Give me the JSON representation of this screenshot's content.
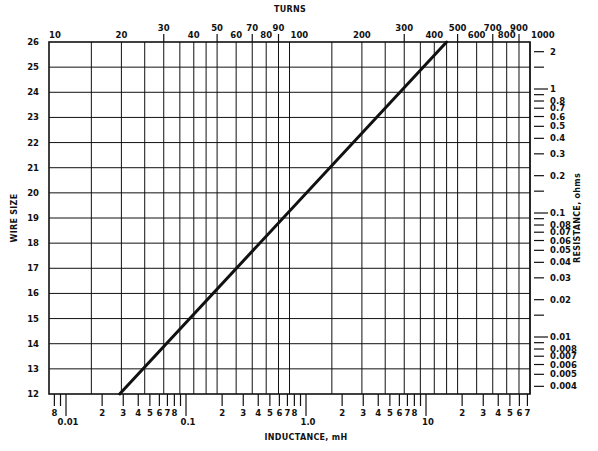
{
  "chart_data": {
    "type": "line",
    "title": "",
    "top_axis": {
      "label": "TURNS",
      "scale": "log",
      "range": [
        10,
        1000
      ],
      "tick_labels": [
        "10",
        "20",
        "30",
        "40",
        "50",
        "60",
        "70",
        "80",
        "90",
        "100",
        "200",
        "300",
        "400",
        "500",
        "600",
        "700",
        "800",
        "900",
        "1000"
      ],
      "tick_values": [
        10,
        20,
        30,
        40,
        50,
        60,
        70,
        80,
        90,
        100,
        200,
        300,
        400,
        500,
        600,
        700,
        800,
        900,
        1000
      ],
      "gridlines": [
        15,
        20,
        25,
        30,
        35,
        40,
        45,
        50,
        60,
        70,
        80,
        90,
        100,
        150,
        200,
        250,
        300,
        350,
        400,
        450,
        500,
        600,
        700,
        800,
        900,
        1000
      ]
    },
    "bottom_axis": {
      "label": "INDUCTANCE, mH",
      "scale": "log",
      "range": [
        0.0066,
        75
      ],
      "major_labels": [
        "0.01",
        "0.1",
        "1.0",
        "10"
      ],
      "major_values": [
        0.01,
        0.1,
        1.0,
        10
      ],
      "minor_labels": [
        {
          "text": "8",
          "value": 0.008
        },
        {
          "text": "2",
          "value": 0.02
        },
        {
          "text": "3",
          "value": 0.03
        },
        {
          "text": "4",
          "value": 0.04
        },
        {
          "text": "5",
          "value": 0.05
        },
        {
          "text": "6",
          "value": 0.06
        },
        {
          "text": "7",
          "value": 0.07
        },
        {
          "text": "8",
          "value": 0.08
        },
        {
          "text": "2",
          "value": 0.2
        },
        {
          "text": "3",
          "value": 0.3
        },
        {
          "text": "4",
          "value": 0.4
        },
        {
          "text": "5",
          "value": 0.5
        },
        {
          "text": "6",
          "value": 0.6
        },
        {
          "text": "7",
          "value": 0.7
        },
        {
          "text": "8",
          "value": 0.8
        },
        {
          "text": "2",
          "value": 2
        },
        {
          "text": "3",
          "value": 3
        },
        {
          "text": "4",
          "value": 4
        },
        {
          "text": "5",
          "value": 5
        },
        {
          "text": "6",
          "value": 6
        },
        {
          "text": "7",
          "value": 7
        },
        {
          "text": "8",
          "value": 8
        },
        {
          "text": "2",
          "value": 20
        },
        {
          "text": "3",
          "value": 30
        },
        {
          "text": "4",
          "value": 40
        },
        {
          "text": "5",
          "value": 50
        },
        {
          "text": "6",
          "value": 60
        },
        {
          "text": "7",
          "value": 70
        }
      ]
    },
    "left_axis": {
      "label": "WIRE SIZE",
      "range": [
        12,
        26
      ],
      "tick_labels": [
        "12",
        "13",
        "14",
        "15",
        "16",
        "17",
        "18",
        "19",
        "20",
        "21",
        "22",
        "23",
        "24",
        "25",
        "26"
      ],
      "gridlines": true
    },
    "right_axis": {
      "label": "RESISTANCE, ohms",
      "scale": "log",
      "tick_labels": [
        "2",
        "1",
        "0.8",
        "0.7",
        "0.6",
        "0.5",
        "0.4",
        "0.3",
        "0.2",
        "0.1",
        "0.08",
        "0.07",
        "0.06",
        "0.05",
        "0.04",
        "0.03",
        "0.02",
        "0.01",
        "0.008",
        "0.007",
        "0.006",
        "0.005",
        "0.004"
      ],
      "tick_values": [
        2,
        1,
        0.8,
        0.7,
        0.6,
        0.5,
        0.4,
        0.3,
        0.2,
        0.1,
        0.08,
        0.07,
        0.06,
        0.05,
        0.04,
        0.03,
        0.02,
        0.01,
        0.008,
        0.007,
        0.006,
        0.005,
        0.004
      ],
      "unlabeled_ticks": [
        1.5,
        0.9,
        0.15,
        0.09,
        0.015,
        0.009
      ]
    },
    "series": [
      {
        "name": "design line",
        "points": [
          {
            "wire_size": 12,
            "inductance_mH": 0.028,
            "turns": 20
          },
          {
            "wire_size": 19,
            "inductance_mH": 0.85,
            "turns": 100
          },
          {
            "wire_size": 26,
            "inductance_mH": 24,
            "turns": 450
          }
        ]
      }
    ],
    "grid": true,
    "legend": "none"
  },
  "labels": {
    "top_title": "TURNS",
    "bottom_title": "INDUCTANCE, mH",
    "left_title": "WIRE SIZE",
    "right_title": "RESISTANCE, ohms"
  }
}
